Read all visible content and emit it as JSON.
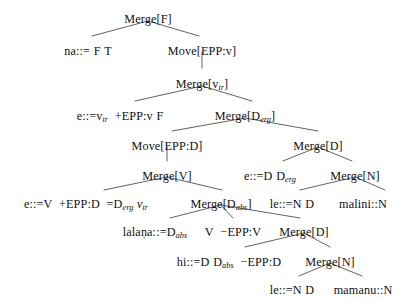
{
  "figure": {
    "kind": "minimalist-grammar-derivation-tree",
    "title": "",
    "line_color": "#3a3a3a",
    "text_color": "#111111",
    "background": "#ffffff",
    "width": 407,
    "height": 301
  },
  "nodes": {
    "n01": {
      "label": "Merge[F]",
      "x": 148,
      "y": 13,
      "kind": "operation"
    },
    "n02": {
      "label": "na::= F T",
      "x": 88,
      "y": 45,
      "kind": "lexical-item"
    },
    "n03": {
      "label": "Move[EPP:v]",
      "x": 202,
      "y": 45,
      "kind": "operation"
    },
    "n04": {
      "label": "Merge[vtr]",
      "x": 202,
      "y": 78,
      "kind": "operation"
    },
    "n05": {
      "label": "e::=vtr +EPP:v F",
      "x": 120,
      "y": 110,
      "kind": "lexical-item"
    },
    "n06": {
      "label": "Merge[Derg]",
      "x": 245,
      "y": 110,
      "kind": "operation"
    },
    "n07": {
      "label": "Move[EPP:D]",
      "x": 167,
      "y": 140,
      "kind": "operation"
    },
    "n08": {
      "label": "Merge[D]",
      "x": 318,
      "y": 140,
      "kind": "operation"
    },
    "n09": {
      "label": "Merge[V]",
      "x": 167,
      "y": 170,
      "kind": "operation"
    },
    "n10": {
      "label": "e::=D Derg",
      "x": 270,
      "y": 170,
      "kind": "lexical-item"
    },
    "n11": {
      "label": "Merge[N]",
      "x": 355,
      "y": 170,
      "kind": "operation"
    },
    "n12": {
      "label": "e::=V +EPP:D =Derg vtr",
      "x": 86,
      "y": 198,
      "kind": "lexical-item"
    },
    "n13": {
      "label": "Merge[Dabs]",
      "x": 221,
      "y": 198,
      "kind": "operation"
    },
    "n14": {
      "label": "le::=N D",
      "x": 292,
      "y": 198,
      "kind": "lexical-item"
    },
    "n15": {
      "label": "malini::N",
      "x": 363,
      "y": 198,
      "kind": "lexical-item"
    },
    "n16": {
      "label": "lalaṇa::=Dabs",
      "x": 155,
      "y": 226,
      "kind": "lexical-item"
    },
    "n17": {
      "label": "V −EPP:V",
      "x": 233,
      "y": 226,
      "kind": "feature-bundle"
    },
    "n18": {
      "label": "Merge[D]",
      "x": 304,
      "y": 226,
      "kind": "operation"
    },
    "n19": {
      "label": "hi::=D Dabs −EPP:D",
      "x": 229,
      "y": 256,
      "kind": "lexical-item"
    },
    "n20": {
      "label": "Merge[N]",
      "x": 330,
      "y": 256,
      "kind": "operation"
    },
    "n21": {
      "label": "le::=N D",
      "x": 292,
      "y": 284,
      "kind": "lexical-item"
    },
    "n22": {
      "label": "mamanu::N",
      "x": 363,
      "y": 284,
      "kind": "lexical-item"
    }
  },
  "edges": [
    {
      "from": "n01",
      "to": "n02",
      "type": "branch"
    },
    {
      "from": "n01",
      "to": "n03",
      "type": "branch"
    },
    {
      "from": "n03",
      "to": "n04",
      "type": "unary"
    },
    {
      "from": "n04",
      "to": "n05",
      "type": "branch"
    },
    {
      "from": "n04",
      "to": "n06",
      "type": "branch"
    },
    {
      "from": "n06",
      "to": "n07",
      "type": "branch"
    },
    {
      "from": "n06",
      "to": "n08",
      "type": "branch"
    },
    {
      "from": "n07",
      "to": "n09",
      "type": "unary"
    },
    {
      "from": "n08",
      "to": "n10",
      "type": "branch"
    },
    {
      "from": "n08",
      "to": "n11",
      "type": "branch"
    },
    {
      "from": "n09",
      "to": "n12",
      "type": "branch"
    },
    {
      "from": "n09",
      "to": "n13",
      "type": "branch"
    },
    {
      "from": "n11",
      "to": "n14",
      "type": "branch"
    },
    {
      "from": "n11",
      "to": "n15",
      "type": "branch"
    },
    {
      "from": "n13",
      "to": "n16",
      "type": "branch"
    },
    {
      "from": "n13",
      "to": "n17",
      "type": "branch"
    },
    {
      "from": "n13",
      "to": "n18",
      "type": "branch"
    },
    {
      "from": "n18",
      "to": "n19",
      "type": "branch"
    },
    {
      "from": "n18",
      "to": "n20",
      "type": "branch"
    },
    {
      "from": "n20",
      "to": "n21",
      "type": "branch"
    },
    {
      "from": "n20",
      "to": "n22",
      "type": "branch"
    }
  ]
}
